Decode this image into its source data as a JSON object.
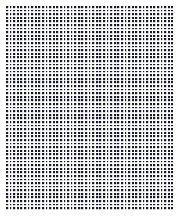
{
  "canvas": {
    "width": 181,
    "height": 223,
    "background_color": "#ffffff",
    "description": "dot-grid-texture"
  },
  "pattern": {
    "name": "square-dot-grid",
    "dot_color": "#1a1a2e",
    "background_color": "#ffffff",
    "dot_size_px": 2,
    "pitch_x_px": 3.6,
    "pitch_y_px": 3.6,
    "columns": 46,
    "rows": 56,
    "origin_x": 6,
    "origin_y": 6,
    "region_width": 167,
    "region_height": 204,
    "margin_left": 6,
    "margin_top": 6,
    "margin_right": 8,
    "margin_bottom": 13
  }
}
